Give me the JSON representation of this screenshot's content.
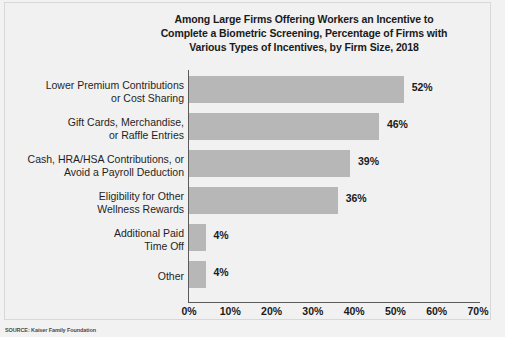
{
  "chart_data": {
    "type": "bar",
    "orientation": "horizontal",
    "title": "Among Large Firms Offering Workers an Incentive to Complete a Biometric Screening, Percentage of Firms with Various Types of Incentives, by Firm Size, 2018",
    "title_lines": [
      "Among Large Firms Offering Workers an Incentive to",
      "Complete a Biometric Screening, Percentage of Firms with",
      "Various Types of Incentives, by Firm Size, 2018"
    ],
    "categories": [
      "Lower Premium Contributions or Cost Sharing",
      "Gift Cards, Merchandise, or Raffle Entries",
      "Cash, HRA/HSA Contributions, or Avoid a Payroll Deduction",
      "Eligibility for Other Wellness Rewards",
      "Additional Paid Time Off",
      "Other"
    ],
    "category_lines": [
      [
        "Lower Premium Contributions",
        "or Cost Sharing"
      ],
      [
        "Gift Cards, Merchandise,",
        "or Raffle Entries"
      ],
      [
        "Cash, HRA/HSA Contributions, or",
        "Avoid a Payroll Deduction"
      ],
      [
        "Eligibility for Other",
        "Wellness Rewards"
      ],
      [
        "Additional Paid",
        "Time Off"
      ],
      [
        "Other"
      ]
    ],
    "values": [
      52,
      46,
      39,
      36,
      4,
      4
    ],
    "value_labels": [
      "52%",
      "46%",
      "39%",
      "36%",
      "4%",
      "4%"
    ],
    "xlabel": "",
    "ylabel": "",
    "xlim": [
      0,
      70
    ],
    "xticks": [
      0,
      10,
      20,
      30,
      40,
      50,
      60,
      70
    ],
    "xtick_labels": [
      "0%",
      "10%",
      "20%",
      "30%",
      "40%",
      "50%",
      "60%",
      "70%"
    ],
    "grid": false,
    "legend": false,
    "bar_color": "#b7b7b7",
    "background_color": "#f1f1f1",
    "text_color": "#1a1a1a"
  },
  "source": {
    "note": "SOURCE: Kaiser Family Foundation"
  }
}
